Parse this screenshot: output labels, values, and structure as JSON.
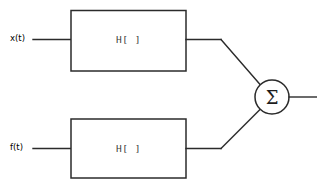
{
  "diagram": {
    "background_color": "#ffffff",
    "stroke_color": "#2b2b2b",
    "inputs": [
      {
        "label": "x(t)",
        "name": "input-signal-x"
      },
      {
        "label": "f(t)",
        "name": "input-signal-f"
      }
    ],
    "blocks": [
      {
        "label": "H[ ]",
        "name": "system-block-upper"
      },
      {
        "label": "H[ ]",
        "name": "system-block-lower"
      }
    ],
    "summing_junction": {
      "symbol": "Σ",
      "name": "summing-junction"
    },
    "output": {
      "label": ""
    }
  }
}
